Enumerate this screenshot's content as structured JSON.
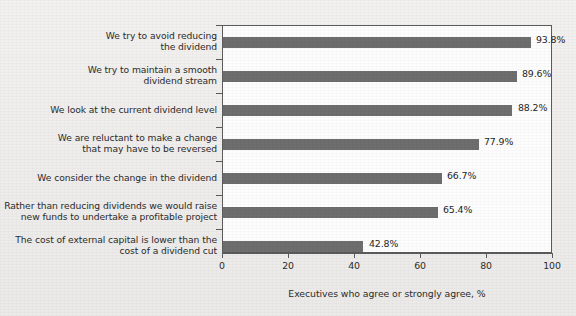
{
  "chart_data": {
    "type": "bar",
    "orientation": "horizontal",
    "title": "",
    "subtitle": "",
    "xlabel": "Executives who agree or strongly agree, %",
    "ylabel": "",
    "xlim": [
      0,
      100
    ],
    "xticks": [
      0,
      20,
      40,
      60,
      80,
      100
    ],
    "xtick_labels": [
      "0",
      "20",
      "40",
      "60",
      "80",
      "100"
    ],
    "grid": false,
    "legend": null,
    "bar_color": "#6e6e6e",
    "plot_background": "#fdfdfd",
    "figure_background": "#efeeec",
    "categories": [
      "We try to avoid reducing\nthe dividend",
      "We try to maintain a smooth\ndividend stream",
      "We look at the current dividend level",
      "We are reluctant to make a change\nthat may have to be reversed",
      "We consider the change in the dividend",
      "Rather than reducing dividends we would raise\nnew funds to undertake a profitable project",
      "The cost of external capital is lower than the\ncost of a dividend cut"
    ],
    "values": [
      93.8,
      89.6,
      88.2,
      77.9,
      66.7,
      65.4,
      42.8
    ],
    "value_labels": [
      "93.8%",
      "89.6%",
      "88.2%",
      "77.9%",
      "66.7%",
      "65.4%",
      "42.8%"
    ]
  }
}
